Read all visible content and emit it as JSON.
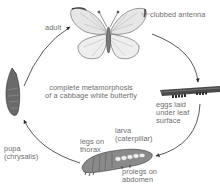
{
  "diagram": {
    "title_lines": [
      "complete metamorphosis",
      "of a cabbage white butterfly"
    ],
    "type": "life-cycle",
    "stages": [
      {
        "id": "adult",
        "lines": [
          "adult"
        ]
      },
      {
        "id": "eggs",
        "lines": [
          "eggs laid",
          "under leaf",
          "surface"
        ]
      },
      {
        "id": "larva",
        "lines": [
          "larva",
          "(caterpillar)"
        ]
      },
      {
        "id": "pupa",
        "lines": [
          "pupa",
          "(chrysalis)"
        ]
      }
    ],
    "annotations": {
      "antenna": [
        "clubbed antenna"
      ],
      "legs": [
        "legs on",
        "thorax"
      ],
      "prolegs": [
        "prolegs on",
        "abdomen"
      ]
    },
    "colors": {
      "line": "#3a3a3a",
      "text": "#6e6e6e",
      "drawing": "#555555"
    }
  }
}
